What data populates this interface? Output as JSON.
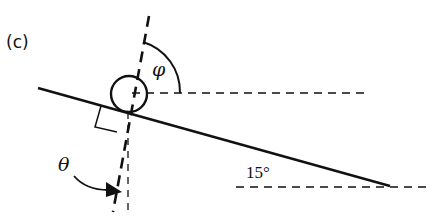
{
  "figure": {
    "panel_label": "(c)",
    "labels": {
      "phi": "φ",
      "theta": "θ",
      "incline_angle": "15°"
    },
    "elements": [
      "incline-line",
      "wheel-circle",
      "tilted-axis-dashed",
      "horizontal-reference-dashed",
      "vertical-reference-dashed",
      "right-angle-marker",
      "phi-angle-arc",
      "theta-rotation-arrow",
      "ground-horizontal-dashed"
    ],
    "colors": {
      "stroke": "#111111",
      "background": "#ffffff"
    }
  }
}
